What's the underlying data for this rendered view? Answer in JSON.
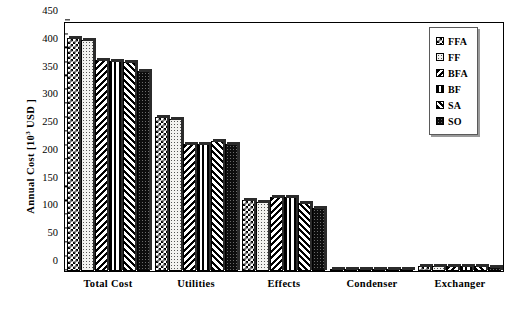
{
  "chart_data": {
    "type": "bar",
    "title": "",
    "subtitle": "",
    "xlabel": "",
    "ylabel": "Annual Cost [10³ USD ]",
    "ylabel_prefix": "Annual  Cost  [10",
    "ylabel_exponent": "3",
    "ylabel_suffix": " USD ]",
    "ylim": [
      0,
      450
    ],
    "yticks": [
      0,
      50,
      100,
      150,
      200,
      250,
      300,
      350,
      400,
      450
    ],
    "ytick_labels": [
      "0",
      "50",
      "100",
      "150",
      "200",
      "250",
      "300",
      "350",
      "400",
      "450"
    ],
    "grid": false,
    "legend_position": "top-right",
    "categories": [
      "Total Cost",
      "Utilities",
      "Effects",
      "Condenser",
      "Exchanger"
    ],
    "series": [
      {
        "name": "FFA",
        "pattern": "checkerboard",
        "values": [
          420,
          278,
          128,
          1,
          9
        ]
      },
      {
        "name": "FF",
        "pattern": "light-dots",
        "values": [
          415,
          274,
          124,
          1,
          9
        ]
      },
      {
        "name": "BFA",
        "pattern": "diagonal-back",
        "values": [
          379,
          229,
          134,
          1,
          9
        ]
      },
      {
        "name": "BF",
        "pattern": "vertical",
        "values": [
          378,
          229,
          134,
          1,
          9
        ]
      },
      {
        "name": "SA",
        "pattern": "diagonal-fwd",
        "values": [
          376,
          234,
          123,
          1,
          9
        ]
      },
      {
        "name": "SO",
        "pattern": "dark-dots",
        "values": [
          360,
          229,
          113,
          1,
          8
        ]
      }
    ]
  },
  "legend": {
    "items": [
      {
        "label": "FFA"
      },
      {
        "label": "FF"
      },
      {
        "label": "BFA"
      },
      {
        "label": "BF"
      },
      {
        "label": "SA"
      },
      {
        "label": "SO"
      }
    ]
  }
}
